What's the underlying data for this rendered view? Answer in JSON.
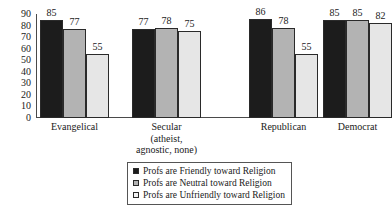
{
  "chart_data": {
    "type": "bar",
    "title": "",
    "subtitle": "",
    "xlabel": "",
    "ylabel": "",
    "ylim": [
      0,
      90
    ],
    "grid": false,
    "legend_position": "bottom-center",
    "y_ticks": [
      "0",
      "10",
      "20",
      "30",
      "40",
      "50",
      "60",
      "70",
      "80",
      "90"
    ],
    "y_tick_values": [
      0,
      10,
      20,
      30,
      40,
      50,
      60,
      70,
      80,
      90
    ],
    "categories": [
      "Evangelical",
      "Secular (atheist, agnostic, none)",
      "Republican",
      "Democrat"
    ],
    "category_lines": [
      [
        "Evangelical"
      ],
      [
        "Secular",
        "(atheist,",
        "agnostic, none)"
      ],
      [
        "Republican"
      ],
      [
        "Democrat"
      ]
    ],
    "series": [
      {
        "name": "Profs are Friendly toward Religion",
        "color": "#1c1c1c",
        "values": [
          85,
          77,
          86,
          85
        ]
      },
      {
        "name": "Profs are Neutral toward Religion",
        "color": "#b3b3b3",
        "values": [
          77,
          78,
          78,
          85
        ]
      },
      {
        "name": "Profs are Unfriendly toward Religion",
        "color": "#e6e6e6",
        "values": [
          55,
          75,
          55,
          82
        ]
      }
    ]
  },
  "legend": {
    "items": [
      {
        "label": "Profs are Friendly toward Religion",
        "swatch": "series-0-swatch"
      },
      {
        "label": "Profs are Neutral toward Religion",
        "swatch": "series-1-swatch"
      },
      {
        "label": "Profs are Unfriendly toward Religion",
        "swatch": "series-2-swatch"
      }
    ]
  }
}
